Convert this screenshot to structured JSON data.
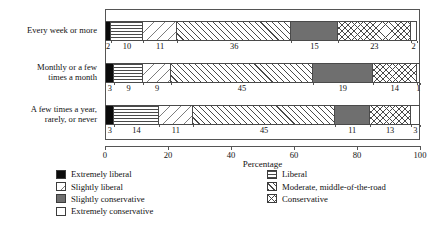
{
  "chart_data": {
    "type": "bar",
    "orientation": "horizontal",
    "stacked": true,
    "normalized_percent": true,
    "title": "",
    "xlabel": "Percentage",
    "ylabel": "",
    "xlim": [
      0,
      100
    ],
    "xticks": [
      0,
      20,
      40,
      60,
      80,
      100
    ],
    "xticklabels": [
      "0",
      "20",
      "40",
      "60",
      "80",
      "100"
    ],
    "grid": false,
    "legend_position": "bottom",
    "categories": [
      "Every week or more",
      "Monthly or a few\ntimes a month",
      "A few times a year,\nrarely, or never"
    ],
    "series": [
      {
        "name": "Extremely liberal",
        "pattern": "solid-black",
        "values": [
          2,
          3,
          3
        ]
      },
      {
        "name": "Liberal",
        "pattern": "horizontal-lines",
        "values": [
          10,
          9,
          14
        ]
      },
      {
        "name": "Slightly liberal",
        "pattern": "sparse-hatch",
        "values": [
          11,
          9,
          11
        ]
      },
      {
        "name": "Moderate, middle-of-the-road",
        "pattern": "diagonal-hatch",
        "values": [
          36,
          45,
          45
        ]
      },
      {
        "name": "Slightly conservative",
        "pattern": "solid-dark-gray",
        "values": [
          15,
          19,
          11
        ]
      },
      {
        "name": "Conservative",
        "pattern": "cross-hatch",
        "values": [
          23,
          14,
          13
        ]
      },
      {
        "name": "Extremely conservative",
        "pattern": "solid-white",
        "values": [
          2,
          1,
          3
        ]
      }
    ]
  },
  "legend": {
    "left_column": [
      {
        "label": "Extremely liberal",
        "pattern": "solid-black"
      },
      {
        "label": "Slightly liberal",
        "pattern": "sparse-hatch"
      },
      {
        "label": "Slightly conservative",
        "pattern": "solid-dark-gray"
      },
      {
        "label": "Extremely conservative",
        "pattern": "solid-white"
      }
    ],
    "right_column": [
      {
        "label": "Liberal",
        "pattern": "horizontal-lines"
      },
      {
        "label": "Moderate, middle-of-the-road",
        "pattern": "diagonal-hatch"
      },
      {
        "label": "Conservative",
        "pattern": "cross-hatch"
      }
    ]
  },
  "colors": {
    "extremely_liberal": "#0b0b0b",
    "slightly_conservative": "#6f6f6f",
    "extremely_conservative": "#ffffff",
    "hatch_stroke": "#4a4a4a",
    "frame": "#555555"
  }
}
